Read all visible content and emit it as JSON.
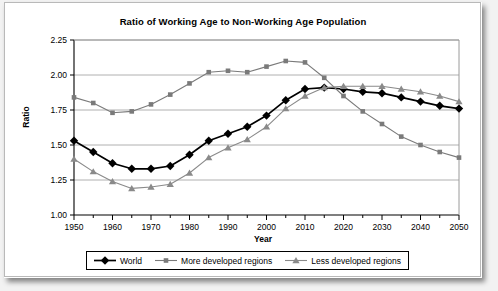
{
  "chart_data": {
    "type": "line",
    "title": "Ratio of Working Age to Non-Working Age Population",
    "xlabel": "Year",
    "ylabel": "Ratio",
    "x": [
      1950,
      1955,
      1960,
      1965,
      1970,
      1975,
      1980,
      1985,
      1990,
      1995,
      2000,
      2005,
      2010,
      2015,
      2020,
      2025,
      2030,
      2035,
      2040,
      2045,
      2050
    ],
    "xlim": [
      1950,
      2050
    ],
    "ylim": [
      1.0,
      2.25
    ],
    "y_ticks": [
      "1.00",
      "1.25",
      "1.50",
      "1.75",
      "2.00",
      "2.25"
    ],
    "y_tick_values": [
      1.0,
      1.25,
      1.5,
      1.75,
      2.0,
      2.25
    ],
    "x_ticks": [
      "1950",
      "1960",
      "1970",
      "1980",
      "1990",
      "2000",
      "2010",
      "2020",
      "2030",
      "2040",
      "2050"
    ],
    "x_tick_values": [
      1950,
      1960,
      1970,
      1980,
      1990,
      2000,
      2010,
      2020,
      2030,
      2040,
      2050
    ],
    "x_minor_step": 5,
    "grid": "horizontal",
    "legend_position": "bottom",
    "series": [
      {
        "name": "World",
        "color": "#000000",
        "marker": "diamond",
        "values": [
          1.53,
          1.45,
          1.37,
          1.33,
          1.33,
          1.35,
          1.43,
          1.53,
          1.58,
          1.63,
          1.71,
          1.82,
          1.9,
          1.91,
          1.9,
          1.88,
          1.87,
          1.84,
          1.81,
          1.78,
          1.76
        ]
      },
      {
        "name": "More developed regions",
        "color": "#7a7a7a",
        "marker": "square",
        "values": [
          1.84,
          1.8,
          1.73,
          1.74,
          1.79,
          1.86,
          1.94,
          2.02,
          2.03,
          2.02,
          2.06,
          2.1,
          2.09,
          1.98,
          1.85,
          1.74,
          1.65,
          1.56,
          1.5,
          1.45,
          1.41
        ]
      },
      {
        "name": "Less developed regions",
        "color": "#8a8a8a",
        "marker": "triangle",
        "values": [
          1.4,
          1.31,
          1.24,
          1.19,
          1.2,
          1.22,
          1.3,
          1.41,
          1.48,
          1.54,
          1.63,
          1.76,
          1.85,
          1.91,
          1.92,
          1.92,
          1.92,
          1.9,
          1.88,
          1.85,
          1.81
        ]
      }
    ]
  },
  "legend": {
    "items": [
      {
        "label": "World"
      },
      {
        "label": "More developed regions"
      },
      {
        "label": "Less developed regions"
      }
    ]
  },
  "colors": {
    "world": "#000000",
    "more_developed": "#7a7a7a",
    "less_developed": "#8a8a8a",
    "grid": "#b0b0b0",
    "axis": "#000000",
    "background": "#ffffff"
  }
}
